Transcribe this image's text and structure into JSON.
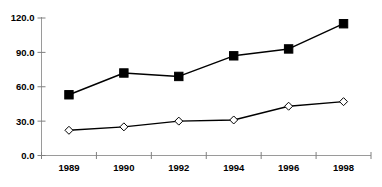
{
  "chart_data": {
    "type": "line",
    "title": "",
    "subtitle": "",
    "xlabel": "",
    "ylabel": "",
    "categories": [
      "1989",
      "1990",
      "1992",
      "1994",
      "1996",
      "1998"
    ],
    "series": [
      {
        "name": "series-filled-square",
        "marker": "filled-square",
        "color": "#000000",
        "values": [
          53,
          72,
          69,
          87,
          93,
          115
        ]
      },
      {
        "name": "series-open-diamond",
        "marker": "open-diamond",
        "color": "#000000",
        "values": [
          22,
          25,
          30,
          31,
          43,
          47
        ]
      }
    ],
    "ylim": [
      0,
      120
    ],
    "yticks": [
      0,
      30,
      60,
      90,
      120
    ],
    "ytick_labels": [
      "0.0",
      "30.0",
      "60.0",
      "90.0",
      "120.0"
    ],
    "xtick_labels": [
      "1989",
      "1990",
      "1992",
      "1994",
      "1996",
      "1998"
    ],
    "grid": false,
    "legend": null,
    "legend_position": "none",
    "annotations": []
  },
  "axes": {
    "y_axis_color": "#808080",
    "x_axis_color": "#808080",
    "line_color": "#000000",
    "marker_fill_square": "#000000",
    "marker_fill_diamond": "#ffffff",
    "marker_stroke": "#000000",
    "background": "#ffffff"
  }
}
